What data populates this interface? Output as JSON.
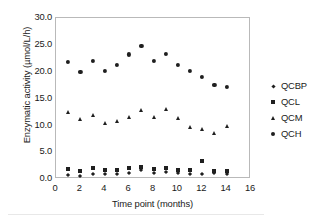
{
  "chart_data": {
    "type": "scatter",
    "title": "",
    "xlabel": "Time point (months)",
    "ylabel": "Enzymatic activity (µmol/L/h)",
    "xlim": [
      0,
      16
    ],
    "ylim": [
      0,
      30
    ],
    "xticks": [
      "0",
      "2",
      "4",
      "6",
      "8",
      "10",
      "12",
      "14",
      "16"
    ],
    "yticks": [
      "0.0",
      "5.0",
      "10.0",
      "15.0",
      "20.0",
      "25.0",
      "30.0"
    ],
    "xtick_values": [
      0,
      2,
      4,
      6,
      8,
      10,
      12,
      14,
      16
    ],
    "ytick_values": [
      0,
      5,
      10,
      15,
      20,
      25,
      30
    ],
    "grid": false,
    "legend_position": "right",
    "x": [
      1,
      2,
      3,
      4,
      5,
      6,
      7,
      8,
      9,
      10,
      11,
      12,
      13,
      14
    ],
    "series": [
      {
        "name": "QCBP",
        "marker": "diamond",
        "color": "#1f1f1f",
        "values": [
          0.8,
          0.5,
          0.9,
          1.0,
          0.9,
          1.2,
          1.6,
          1.2,
          1.3,
          1.1,
          1.0,
          0.9,
          1.1,
          1.0
        ]
      },
      {
        "name": "QCL",
        "marker": "square",
        "color": "#1f1f1f",
        "values": [
          1.9,
          1.5,
          2.0,
          1.7,
          1.6,
          2.0,
          2.3,
          1.9,
          2.1,
          1.7,
          1.7,
          3.3,
          1.5,
          1.5
        ]
      },
      {
        "name": "QCM",
        "marker": "triangle",
        "color": "#1f1f1f",
        "values": [
          12.5,
          11.2,
          12.0,
          10.5,
          10.9,
          11.6,
          12.8,
          11.5,
          13.0,
          11.3,
          9.6,
          9.3,
          8.6,
          9.9
        ]
      },
      {
        "name": "QCH",
        "marker": "circle",
        "color": "#1f1f1f",
        "values": [
          21.8,
          19.9,
          22.0,
          20.1,
          21.2,
          23.2,
          24.8,
          22.0,
          23.3,
          21.3,
          20.1,
          19.0,
          17.5,
          17.2
        ]
      }
    ]
  },
  "legend": {
    "items": [
      {
        "label": "QCBP",
        "marker": "diamond"
      },
      {
        "label": "QCL",
        "marker": "square"
      },
      {
        "label": "QCM",
        "marker": "triangle"
      },
      {
        "label": "QCH",
        "marker": "circle"
      }
    ]
  }
}
